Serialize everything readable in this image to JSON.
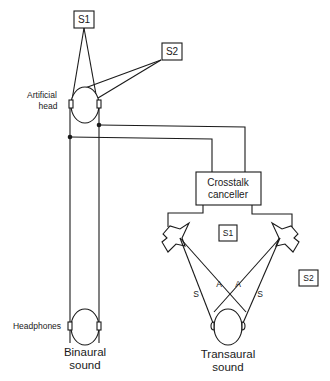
{
  "diagram": {
    "type": "binaural-transaural-signal-flow",
    "sources": {
      "top_s1": "S1",
      "top_s2": "S2",
      "bottom_s1": "S1",
      "bottom_s2": "S2"
    },
    "labels": {
      "artificial_head_line1": "Artificial",
      "artificial_head_line2": "head",
      "crosstalk_line1": "Crosstalk",
      "crosstalk_line2": "canceller",
      "headphones": "Headphones",
      "binaural_line1": "Binaural",
      "binaural_line2": "sound",
      "transaural_line1": "Transaural",
      "transaural_line2": "sound"
    },
    "paths": {
      "left_direct": "S",
      "left_cross": "A",
      "right_cross": "A",
      "right_direct": "S"
    },
    "nodes": [
      "S1 (top)",
      "S2 (top)",
      "Artificial head",
      "Crosstalk canceller",
      "Left loudspeaker",
      "Right loudspeaker",
      "Headphones listener",
      "Transaural listener"
    ],
    "edges": [
      [
        "S1 (top)",
        "Artificial head"
      ],
      [
        "S2 (top)",
        "Artificial head"
      ],
      [
        "Artificial head",
        "Headphones listener"
      ],
      [
        "Artificial head",
        "Crosstalk canceller"
      ],
      [
        "Crosstalk canceller",
        "Left loudspeaker"
      ],
      [
        "Crosstalk canceller",
        "Right loudspeaker"
      ],
      [
        "Left loudspeaker",
        "Transaural listener"
      ],
      [
        "Right loudspeaker",
        "Transaural listener"
      ]
    ],
    "colors": {
      "ink": "#1a1a1a",
      "background": "#ffffff"
    }
  }
}
